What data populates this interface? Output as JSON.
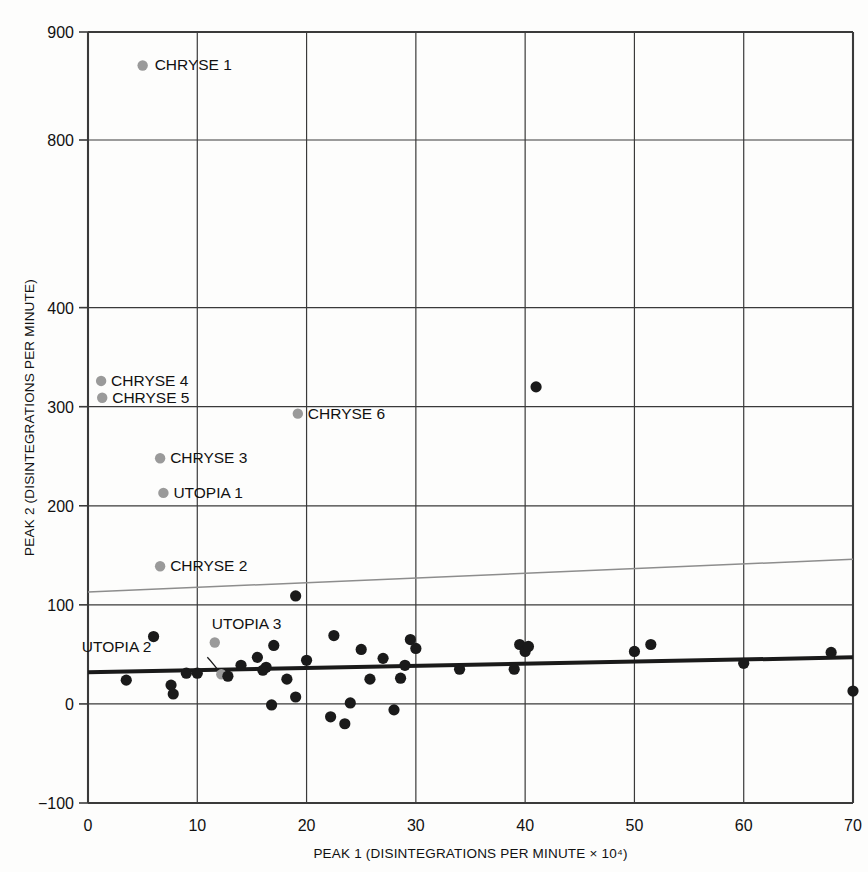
{
  "chart_data": {
    "type": "scatter",
    "title": "",
    "xlabel": "PEAK 1 (DISINTEGRATIONS PER MINUTE × 10⁴)",
    "ylabel": "PEAK 2 (DISINTEGRATIONS PER MINUTE)",
    "xlim": [
      0,
      70
    ],
    "xticks": [
      0,
      10,
      20,
      30,
      40,
      50,
      60,
      70
    ],
    "xtick_labels": [
      "0",
      "10",
      "20",
      "30",
      "40",
      "50",
      "60",
      "70"
    ],
    "ylim_lower_panel": [
      -100,
      440
    ],
    "ylim_upper_panel": [
      770,
      900
    ],
    "yticks": [
      -100,
      0,
      100,
      200,
      300,
      400,
      800,
      900
    ],
    "ytick_labels": [
      "−100",
      "0",
      "100",
      "200",
      "300",
      "400",
      "800",
      "900"
    ],
    "axis_break": true,
    "axis_break_note": "Y axis is broken between 400 and 800",
    "grid": true,
    "legend": "none",
    "series": [
      {
        "name": "labelled samples",
        "marker": "filled circle",
        "color": "#9a9a9a",
        "points": [
          {
            "label": "CHRYSE 1",
            "x": 5.0,
            "y": 869,
            "label_dx": 12,
            "label_dy": 5
          },
          {
            "label": "CHRYSE 4",
            "x": 1.2,
            "y": 326,
            "label_dx": 10,
            "label_dy": 5
          },
          {
            "label": "CHRYSE 5",
            "x": 1.3,
            "y": 309,
            "label_dx": 10,
            "label_dy": 5
          },
          {
            "label": "CHRYSE 6",
            "x": 19.2,
            "y": 293,
            "label_dx": 10,
            "label_dy": 5
          },
          {
            "label": "CHRYSE 3",
            "x": 6.6,
            "y": 248,
            "label_dx": 10,
            "label_dy": 5
          },
          {
            "label": "UTOPIA 1",
            "x": 6.9,
            "y": 213,
            "label_dx": 10,
            "label_dy": 5
          },
          {
            "label": "CHRYSE 2",
            "x": 6.6,
            "y": 139,
            "label_dx": 10,
            "label_dy": 5
          },
          {
            "label": "UTOPIA 3",
            "x": 11.6,
            "y": 62,
            "label_dx": -3,
            "label_dy": -14
          },
          {
            "label": "UTOPIA 2",
            "x": 12.2,
            "y": 30,
            "label_dx": -70,
            "label_dy": -22,
            "leader": true
          }
        ]
      },
      {
        "name": "unlabelled samples",
        "marker": "filled circle",
        "color": "#1a1a1a",
        "points": [
          {
            "x": 41.0,
            "y": 320
          },
          {
            "x": 19.0,
            "y": 109
          },
          {
            "x": 6.0,
            "y": 68
          },
          {
            "x": 22.5,
            "y": 69
          },
          {
            "x": 17.0,
            "y": 59
          },
          {
            "x": 25.0,
            "y": 55
          },
          {
            "x": 29.5,
            "y": 65
          },
          {
            "x": 30.0,
            "y": 56
          },
          {
            "x": 39.5,
            "y": 60
          },
          {
            "x": 40.0,
            "y": 53
          },
          {
            "x": 40.3,
            "y": 58
          },
          {
            "x": 51.5,
            "y": 60
          },
          {
            "x": 50.0,
            "y": 53
          },
          {
            "x": 14.0,
            "y": 39
          },
          {
            "x": 15.5,
            "y": 47
          },
          {
            "x": 16.3,
            "y": 37
          },
          {
            "x": 20.0,
            "y": 44
          },
          {
            "x": 27.0,
            "y": 46
          },
          {
            "x": 29.0,
            "y": 39
          },
          {
            "x": 34.0,
            "y": 35
          },
          {
            "x": 39.0,
            "y": 35
          },
          {
            "x": 60.0,
            "y": 41
          },
          {
            "x": 68.0,
            "y": 52
          },
          {
            "x": 9.0,
            "y": 31
          },
          {
            "x": 10.0,
            "y": 31
          },
          {
            "x": 12.8,
            "y": 28
          },
          {
            "x": 3.5,
            "y": 24
          },
          {
            "x": 7.6,
            "y": 19
          },
          {
            "x": 16.0,
            "y": 34
          },
          {
            "x": 18.2,
            "y": 25
          },
          {
            "x": 25.8,
            "y": 25
          },
          {
            "x": 28.6,
            "y": 26
          },
          {
            "x": 7.8,
            "y": 10
          },
          {
            "x": 19.0,
            "y": 7
          },
          {
            "x": 24.0,
            "y": 1
          },
          {
            "x": 16.8,
            "y": -1
          },
          {
            "x": 22.2,
            "y": -13
          },
          {
            "x": 28.0,
            "y": -6
          },
          {
            "x": 23.5,
            "y": -20
          },
          {
            "x": 70.0,
            "y": 13
          }
        ]
      }
    ],
    "lines": [
      {
        "name": "regression line (all samples)",
        "color": "#1a1a1a",
        "width": 4,
        "x0": 0,
        "y0": 32,
        "x1": 70,
        "y1": 47
      },
      {
        "name": "upper reference line",
        "color": "#8d8d8d",
        "width": 1.5,
        "x0": 0,
        "y0": 113,
        "x1": 70,
        "y1": 146
      }
    ]
  },
  "labels": {
    "top_partial_text": "",
    "bottom_caption_text": ""
  }
}
